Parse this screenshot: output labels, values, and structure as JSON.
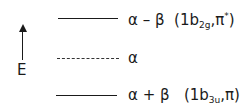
{
  "diagram": {
    "type": "molecular orbital energy level diagram",
    "axis": {
      "label": "E",
      "direction": "up"
    },
    "levels": [
      {
        "energy": "α − β",
        "main": "α – β",
        "orbital_prefix": "(1b",
        "orbital_sub": "2g",
        "orbital_mid": ",π",
        "orbital_sup": "*",
        "orbital_suffix": ")",
        "style": "solid"
      },
      {
        "energy": "α",
        "main": "α",
        "style": "dashed"
      },
      {
        "energy": "α + β",
        "main": "α + β",
        "orbital_prefix": "(1b",
        "orbital_sub": "3u",
        "orbital_mid": ",π",
        "orbital_suffix": ")",
        "style": "solid"
      }
    ]
  }
}
